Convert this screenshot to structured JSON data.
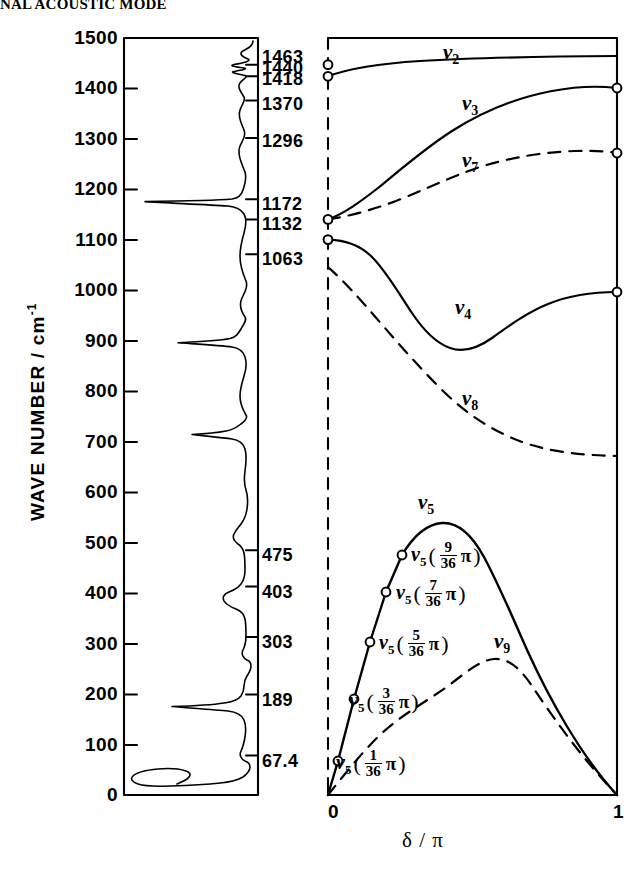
{
  "header": {
    "text": "NAL ACOUSTIC MODE"
  },
  "axes": {
    "y_label_main": "WAVE NUMBER / cm",
    "y_label_exponent": "-1",
    "y_ticks": [
      0,
      100,
      200,
      300,
      400,
      500,
      600,
      700,
      800,
      900,
      1000,
      1100,
      1200,
      1300,
      1400,
      1500
    ],
    "y_min": 0,
    "y_max": 1500,
    "x_label": "δ / π",
    "x_ticks": [
      "0",
      "1"
    ],
    "x_min": 0,
    "x_max": 1
  },
  "spectrum_ticks": {
    "caption": "observed band wavenumbers",
    "values": [
      1463,
      1440,
      1418,
      1370,
      1296,
      1172,
      1132,
      1063,
      475,
      403,
      303,
      189,
      67.4
    ],
    "labels": [
      "1463",
      "1440",
      "1418",
      "1370",
      "1296",
      "1172",
      "1132",
      "1063",
      "475",
      "403",
      "303",
      "189",
      "67.4"
    ],
    "ticked": [
      true,
      true,
      false,
      true,
      true,
      true,
      true,
      true,
      true,
      true,
      true,
      true,
      true
    ]
  },
  "chart_data": {
    "type": "line",
    "xlabel": "δ / π",
    "ylabel": "WAVE NUMBER / cm^-1",
    "xlim": [
      0,
      1
    ],
    "ylim": [
      0,
      1500
    ],
    "grid": false,
    "legend": "inline curve labels",
    "panels": [
      {
        "name": "spectrum-panel",
        "type": "line",
        "orientation": "vertical",
        "description": "Infrared/Raman absorption spectrum plotted with wavenumber on the vertical axis; peaks extend to the left.",
        "peaks": [
          1463,
          1440,
          1418,
          1370,
          1296,
          1172,
          1132,
          1063,
          475,
          403,
          303,
          189,
          67.4
        ]
      },
      {
        "name": "dispersion-panel",
        "type": "line",
        "series": [
          {
            "name": "ν2",
            "label": "ν",
            "sub": "2",
            "style": "solid",
            "endpoint_markers": [
              true,
              false
            ],
            "x": [
              0,
              0.1,
              0.2,
              0.3,
              0.4,
              0.5,
              0.6,
              0.7,
              0.8,
              0.9,
              1.0
            ],
            "y": [
              1440,
              1449,
              1455,
              1459,
              1462,
              1464,
              1466,
              1467,
              1468,
              1469,
              1469
            ]
          },
          {
            "name": "ν3",
            "label": "ν",
            "sub": "3",
            "style": "solid",
            "endpoint_markers": [
              true,
              true
            ],
            "x": [
              0,
              0.1,
              0.2,
              0.3,
              0.4,
              0.5,
              0.6,
              0.7,
              0.8,
              0.9,
              1.0
            ],
            "y": [
              1172,
              1205,
              1248,
              1295,
              1335,
              1367,
              1390,
              1405,
              1414,
              1418,
              1415
            ]
          },
          {
            "name": "ν7",
            "label": "ν",
            "sub": "7",
            "style": "dashed",
            "endpoint_markers": [
              true,
              true
            ],
            "x": [
              0,
              0.1,
              0.2,
              0.3,
              0.4,
              0.5,
              0.6,
              0.7,
              0.8,
              0.9,
              1.0
            ],
            "y": [
              1172,
              1186,
              1210,
              1240,
              1268,
              1290,
              1305,
              1313,
              1315,
              1312,
              1305
            ]
          },
          {
            "name": "ν4",
            "label": "ν",
            "sub": "4",
            "style": "solid",
            "endpoint_markers": [
              true,
              true
            ],
            "x": [
              0,
              0.1,
              0.2,
              0.3,
              0.4,
              0.5,
              0.6,
              0.7,
              0.8,
              0.9,
              1.0
            ],
            "y": [
              1132,
              1124,
              1090,
              1030,
              978,
              970,
              1000,
              1035,
              1057,
              1065,
              1066
            ]
          },
          {
            "name": "ν8",
            "label": "ν",
            "sub": "8",
            "style": "dashed",
            "endpoint_markers": [
              true,
              false
            ],
            "x": [
              0,
              0.1,
              0.2,
              0.3,
              0.4,
              0.5,
              0.6,
              0.7,
              0.8,
              0.9,
              1.0
            ],
            "y": [
              1047,
              1012,
              960,
              900,
              845,
              800,
              765,
              742,
              728,
              722,
              720
            ]
          },
          {
            "name": "ν5",
            "label": "ν",
            "sub": "5",
            "style": "solid",
            "endpoint_markers": [
              false,
              false
            ],
            "x": [
              0,
              0.0278,
              0.0833,
              0.1389,
              0.1944,
              0.25,
              0.3,
              0.35,
              0.4,
              0.5,
              0.6,
              0.7,
              0.8,
              0.9,
              1.0
            ],
            "y": [
              0,
              67.4,
              189,
              303,
              403,
              475,
              520,
              550,
              560,
              540,
              470,
              375,
              265,
              140,
              0
            ]
          },
          {
            "name": "ν9",
            "label": "ν",
            "sub": "9",
            "style": "dashed",
            "endpoint_markers": [
              false,
              false
            ],
            "x": [
              0,
              0.1,
              0.2,
              0.3,
              0.4,
              0.5,
              0.6,
              0.7,
              0.8,
              0.9,
              1.0
            ],
            "y": [
              0,
              80,
              145,
              190,
              215,
              222,
              212,
              188,
              150,
              90,
              0
            ]
          }
        ],
        "marker_points": [
          {
            "label": "ν5(1/36π)",
            "x": 0.0278,
            "y": 67.4
          },
          {
            "label": "ν5(3/36π)",
            "x": 0.0833,
            "y": 189
          },
          {
            "label": "ν5(5/36π)",
            "x": 0.1389,
            "y": 303
          },
          {
            "label": "ν5(7/36π)",
            "x": 0.1944,
            "y": 403
          },
          {
            "label": "ν5(9/36π)",
            "x": 0.25,
            "y": 475
          }
        ],
        "edge_circles_left": [
          1463,
          1440,
          1172,
          1132
        ],
        "edge_circles_right": [
          1415,
          1305,
          1066
        ]
      }
    ]
  },
  "curve_labels": [
    {
      "name": "nu2",
      "nu": "ν",
      "sub": "2"
    },
    {
      "name": "nu3",
      "nu": "ν",
      "sub": "3"
    },
    {
      "name": "nu7",
      "nu": "ν",
      "sub": "7"
    },
    {
      "name": "nu4",
      "nu": "ν",
      "sub": "4"
    },
    {
      "name": "nu8",
      "nu": "ν",
      "sub": "8"
    },
    {
      "name": "nu5",
      "nu": "ν",
      "sub": "5"
    },
    {
      "name": "nu9",
      "nu": "ν",
      "sub": "9"
    }
  ],
  "fraction_labels": [
    {
      "nu": "ν",
      "sub": "5",
      "num": "9",
      "den": "36",
      "pi": "π"
    },
    {
      "nu": "ν",
      "sub": "5",
      "num": "7",
      "den": "36",
      "pi": "π"
    },
    {
      "nu": "ν",
      "sub": "5",
      "num": "5",
      "den": "36",
      "pi": "π"
    },
    {
      "nu": "ν",
      "sub": "5",
      "num": "3",
      "den": "36",
      "pi": "π"
    },
    {
      "nu": "ν",
      "sub": "5",
      "num": "1",
      "den": "36",
      "pi": "π"
    }
  ],
  "colors": {
    "ink": "#000000",
    "paper": "#ffffff"
  }
}
